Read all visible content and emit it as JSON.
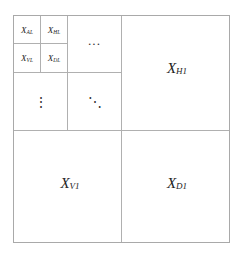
{
  "diagram": {
    "subbands": {
      "level_L": {
        "approx": {
          "base": "X",
          "sub": "AL"
        },
        "horizontal": {
          "base": "X",
          "sub": "HL"
        },
        "vertical": {
          "base": "X",
          "sub": "VL"
        },
        "diagonal": {
          "base": "X",
          "sub": "DL"
        }
      },
      "level_1": {
        "horizontal": {
          "base": "X",
          "sub": "H1"
        },
        "vertical": {
          "base": "X",
          "sub": "V1"
        },
        "diagonal": {
          "base": "X",
          "sub": "D1"
        }
      }
    },
    "ellipsis": {
      "horizontal": "···",
      "vertical": "⋮",
      "diagonal": "⋱"
    },
    "colors": {
      "grid_line": "#b0b0b0",
      "border": "#a9a9a9",
      "text": "#222222"
    }
  }
}
